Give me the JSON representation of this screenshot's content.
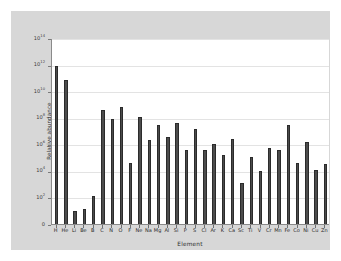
{
  "figure": {
    "background_color": "#ffffff",
    "panel_color": "#d7d7d7",
    "plot_background": "#ffffff",
    "bar_color": "#4c4c4c",
    "grid_color": "#e3e3e3",
    "axis_color": "#8a8a8a"
  },
  "chart_data": {
    "type": "bar",
    "title": "",
    "xlabel": "Element",
    "ylabel": "Relative abundance",
    "scale": "log",
    "grid": true,
    "legend": false,
    "ylim": [
      1,
      100000000000000.0
    ],
    "ytick_values": [
      0,
      100,
      10000,
      1000000,
      100000000,
      10000000000,
      1000000000000,
      100000000000000
    ],
    "ytick_labels": [
      "0",
      "10^2",
      "10^4",
      "10^6",
      "10^8",
      "10^10",
      "10^12",
      "10^14"
    ],
    "ytick_mantissas": [
      "0",
      "10",
      "10",
      "10",
      "10",
      "10",
      "10",
      "10"
    ],
    "ytick_exponents": [
      "",
      "2",
      "4",
      "6",
      "8",
      "10",
      "12",
      "14"
    ],
    "categories": [
      "H",
      "He",
      "Li",
      "Be",
      "B",
      "C",
      "N",
      "O",
      "F",
      "Ne",
      "Na",
      "Mg",
      "Al",
      "Si",
      "P",
      "S",
      "Cl",
      "Ar",
      "K",
      "Ca",
      "Sc",
      "Ti",
      "V",
      "Cr",
      "Mn",
      "Fe",
      "Co",
      "Ni",
      "Cu",
      "Zn"
    ],
    "values": [
      800000000000.0,
      70000000000.0,
      10.0,
      13.0,
      130.0,
      400000000.0,
      80000000.0,
      600000000.0,
      40000.0,
      120000000.0,
      2000000.0,
      30000000.0,
      3400000.0,
      40000000.0,
      380000.0,
      15000000.0,
      360000.0,
      1100000.0,
      150000.0,
      2400000.0,
      1200.0,
      120000.0,
      9500.0,
      500000.0,
      350000.0,
      30000000.0,
      40000.0,
      1400000.0,
      12000.0,
      35000.0
    ]
  }
}
